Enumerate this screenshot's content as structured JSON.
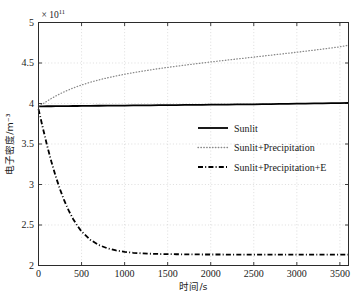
{
  "chart_data": {
    "type": "line",
    "title": "",
    "xlabel": "时间/s",
    "ylabel": "电子密度/m⁻³",
    "y_exponent_label": "× 10",
    "y_exponent_power": "11",
    "y_scale": 100000000000.0,
    "xlim": [
      0,
      3600
    ],
    "ylim": [
      2,
      5
    ],
    "xticks": [
      0,
      500,
      1000,
      1500,
      2000,
      2500,
      3000,
      3500
    ],
    "xtick_labels": [
      "0",
      "500",
      "1000",
      "1500",
      "2000",
      "2500",
      "3000",
      "3500"
    ],
    "yticks": [
      2,
      2.5,
      3,
      3.5,
      4,
      4.5,
      5
    ],
    "ytick_labels": [
      "2",
      "2.5",
      "3",
      "3.5",
      "4",
      "4.5",
      "5"
    ],
    "grid": true,
    "legend_position": "center-right",
    "colors": {
      "axis": "#2b2b2b",
      "grid": "#c8c8c8",
      "series_solid": "#000000",
      "series_dotted": "#8a8a8a",
      "series_dashdot": "#000000",
      "background": "#ffffff"
    },
    "x": [
      0,
      50,
      100,
      150,
      200,
      250,
      300,
      350,
      400,
      450,
      500,
      600,
      700,
      800,
      900,
      1000,
      1100,
      1200,
      1300,
      1400,
      1500,
      1600,
      1700,
      1800,
      1900,
      2000,
      2100,
      2200,
      2300,
      2400,
      2500,
      2600,
      2700,
      2800,
      2900,
      3000,
      3100,
      3200,
      3300,
      3400,
      3500,
      3600
    ],
    "series": [
      {
        "name": "Sunlit",
        "style": "solid",
        "color": "#000000",
        "width": 1.8,
        "values": [
          3.965,
          3.965,
          3.966,
          3.966,
          3.967,
          3.967,
          3.968,
          3.968,
          3.969,
          3.969,
          3.97,
          3.971,
          3.972,
          3.973,
          3.974,
          3.975,
          3.976,
          3.977,
          3.978,
          3.979,
          3.98,
          3.981,
          3.982,
          3.983,
          3.984,
          3.985,
          3.986,
          3.987,
          3.988,
          3.989,
          3.99,
          3.992,
          3.993,
          3.995,
          3.996,
          3.998,
          3.999,
          4.001,
          4.002,
          4.004,
          4.005,
          4.007
        ]
      },
      {
        "name": "Sunlit+Precipitation",
        "style": "dotted",
        "color": "#8a8a8a",
        "width": 1.3,
        "values": [
          3.965,
          3.995,
          4.03,
          4.062,
          4.092,
          4.12,
          4.145,
          4.168,
          4.19,
          4.21,
          4.228,
          4.262,
          4.291,
          4.317,
          4.34,
          4.361,
          4.38,
          4.398,
          4.415,
          4.431,
          4.446,
          4.46,
          4.474,
          4.487,
          4.5,
          4.513,
          4.525,
          4.537,
          4.549,
          4.561,
          4.573,
          4.585,
          4.597,
          4.609,
          4.621,
          4.633,
          4.646,
          4.659,
          4.672,
          4.686,
          4.7,
          4.72
        ]
      },
      {
        "name": "Sunlit+Precipitation+E",
        "style": "dashdot",
        "color": "#000000",
        "width": 1.8,
        "values": [
          3.93,
          3.7,
          3.48,
          3.28,
          3.1,
          2.94,
          2.8,
          2.68,
          2.578,
          2.492,
          2.42,
          2.318,
          2.253,
          2.212,
          2.186,
          2.168,
          2.157,
          2.15,
          2.145,
          2.142,
          2.14,
          2.139,
          2.138,
          2.137,
          2.136,
          2.136,
          2.136,
          2.135,
          2.135,
          2.135,
          2.135,
          2.135,
          2.135,
          2.135,
          2.135,
          2.135,
          2.135,
          2.135,
          2.135,
          2.135,
          2.135,
          2.135
        ]
      }
    ],
    "legend": [
      {
        "label": "Sunlit",
        "style": "solid",
        "color": "#000000"
      },
      {
        "label": "Sunlit+Precipitation",
        "style": "dotted",
        "color": "#8a8a8a"
      },
      {
        "label": "Sunlit+Precipitation+E",
        "style": "dashdot",
        "color": "#000000"
      }
    ]
  }
}
